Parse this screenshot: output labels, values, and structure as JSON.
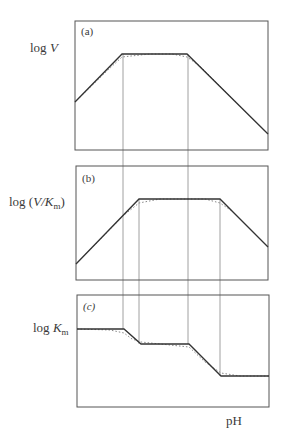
{
  "figure": {
    "x_axis_label": "pH",
    "panels": [
      {
        "tag": "(a)",
        "y_label_prefix": "log ",
        "y_label_var": "V",
        "y_label_sub": "",
        "y_label_suffix": "",
        "box": [
          75,
          21,
          268,
          150
        ],
        "solid": [
          [
            75,
            102
          ],
          [
            122,
            54
          ],
          [
            187,
            54
          ],
          [
            268,
            134
          ]
        ],
        "dotted": [
          [
            75,
            102
          ],
          [
            108,
            70
          ],
          [
            122,
            57
          ],
          [
            150,
            54
          ],
          [
            172,
            54
          ],
          [
            187,
            57
          ],
          [
            200,
            66
          ],
          [
            268,
            134
          ]
        ]
      },
      {
        "tag": "(b)",
        "y_label_prefix": "log (",
        "y_label_var": "V/K",
        "y_label_sub": "m",
        "y_label_suffix": ")",
        "box": [
          76,
          166,
          268,
          280
        ],
        "solid": [
          [
            76,
            264
          ],
          [
            139,
            199
          ],
          [
            220,
            199
          ],
          [
            268,
            247
          ]
        ],
        "dotted": [
          [
            76,
            264
          ],
          [
            124,
            215
          ],
          [
            139,
            203
          ],
          [
            160,
            199
          ],
          [
            205,
            199
          ],
          [
            220,
            203
          ],
          [
            232,
            211
          ],
          [
            268,
            247
          ]
        ]
      },
      {
        "tag": "(c)",
        "y_label_prefix": "log ",
        "y_label_var": "K",
        "y_label_sub": "m",
        "y_label_suffix": "",
        "box": [
          77,
          295,
          269,
          407
        ],
        "solid": [
          [
            77,
            329
          ],
          [
            124,
            329
          ],
          [
            141,
            344
          ],
          [
            189,
            344
          ],
          [
            221,
            376
          ],
          [
            269,
            376
          ]
        ],
        "dotted": [
          [
            77,
            329
          ],
          [
            110,
            330
          ],
          [
            124,
            333
          ],
          [
            132,
            339
          ],
          [
            141,
            342
          ],
          [
            170,
            345
          ],
          [
            189,
            347
          ],
          [
            205,
            362
          ],
          [
            221,
            373
          ],
          [
            240,
            376
          ],
          [
            269,
            376
          ]
        ]
      }
    ],
    "guide_lines_x": [
      123,
      139,
      188,
      220
    ],
    "guide_spans": [
      {
        "x": 123,
        "y1": 54,
        "y2": 329
      },
      {
        "x": 188,
        "y1": 54,
        "y2": 344
      },
      {
        "x": 139,
        "y1": 199,
        "y2": 344
      },
      {
        "x": 220,
        "y1": 199,
        "y2": 376
      }
    ],
    "colors": {
      "frame": "#555555",
      "curve": "#333333",
      "dotted": "#888888",
      "guide": "#888888"
    }
  }
}
